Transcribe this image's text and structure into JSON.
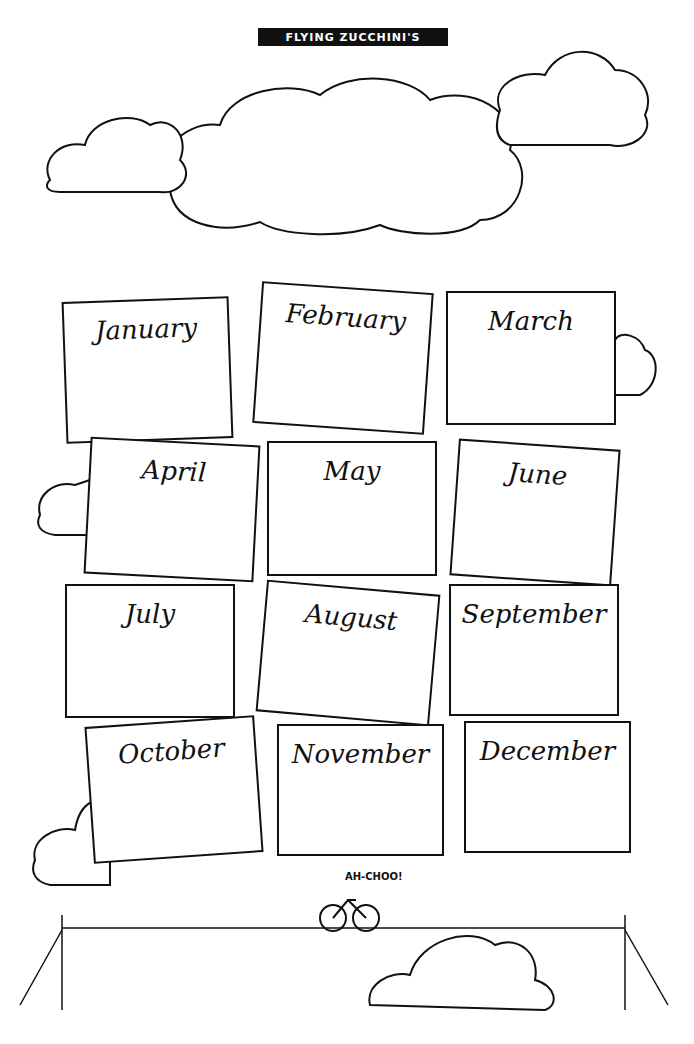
{
  "banner": {
    "text": "FLYING ZUCCHINI'S"
  },
  "sneeze": {
    "text": "AH-CHOO!"
  },
  "months": [
    {
      "label": "January",
      "x": 65,
      "y": 300,
      "w": 165,
      "h": 140,
      "rot": -2
    },
    {
      "label": "February",
      "x": 258,
      "y": 288,
      "w": 170,
      "h": 140,
      "rot": 4
    },
    {
      "label": "March",
      "x": 447,
      "y": 292,
      "w": 168,
      "h": 132,
      "rot": 0
    },
    {
      "label": "April",
      "x": 88,
      "y": 442,
      "w": 168,
      "h": 135,
      "rot": 3
    },
    {
      "label": "May",
      "x": 268,
      "y": 442,
      "w": 168,
      "h": 133,
      "rot": 0
    },
    {
      "label": "June",
      "x": 455,
      "y": 445,
      "w": 160,
      "h": 135,
      "rot": 4
    },
    {
      "label": "July",
      "x": 66,
      "y": 585,
      "w": 168,
      "h": 132,
      "rot": 0
    },
    {
      "label": "August",
      "x": 262,
      "y": 588,
      "w": 172,
      "h": 130,
      "rot": 5
    },
    {
      "label": "September",
      "x": 450,
      "y": 585,
      "w": 168,
      "h": 130,
      "rot": 0
    },
    {
      "label": "October",
      "x": 90,
      "y": 722,
      "w": 168,
      "h": 135,
      "rot": -4
    },
    {
      "label": "November",
      "x": 278,
      "y": 725,
      "w": 165,
      "h": 130,
      "rot": 0
    },
    {
      "label": "December",
      "x": 465,
      "y": 722,
      "w": 165,
      "h": 130,
      "rot": 0
    }
  ]
}
